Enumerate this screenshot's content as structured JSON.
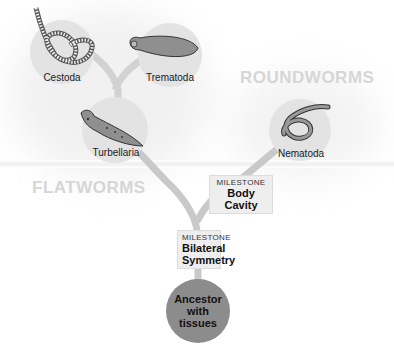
{
  "groups": {
    "flatworms": "FLATWORMS",
    "roundworms": "ROUNDWORMS"
  },
  "taxa": {
    "cestoda": "Cestoda",
    "trematoda": "Trematoda",
    "turbellaria": "Turbellaria",
    "nematoda": "Nematoda"
  },
  "milestones": [
    {
      "kicker": "MILESTONE",
      "title": "Body Cavity"
    },
    {
      "kicker": "MILESTONE",
      "title": "Bilateral Symmetry"
    }
  ],
  "ancestor": "Ancestor with tissues",
  "colors": {
    "branch": "#c9c9c9",
    "node_bg": "#e6e6e6",
    "ancestor": "#8c8c8c",
    "group_label": "#d6d6d6"
  }
}
